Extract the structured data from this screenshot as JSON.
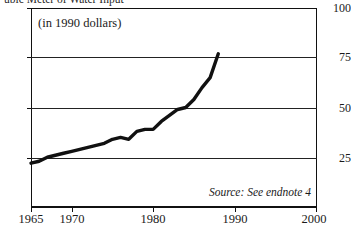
{
  "figure": {
    "running_title": "ubic Meter of Water Input",
    "units_note": "(in 1990 dollars)",
    "source_note": "Source: See endnote 4"
  },
  "axis": {
    "y_labels": [
      "100",
      "75",
      "50",
      "25"
    ],
    "x_labels": [
      "1965",
      "1970",
      "1980",
      "1990",
      "2000"
    ]
  },
  "chart_data": {
    "type": "line",
    "title": "ubic Meter of Water Input",
    "subtitle": "(in 1990 dollars)",
    "xlabel": "",
    "ylabel": "",
    "xlim": [
      1965,
      2000
    ],
    "ylim": [
      0,
      100
    ],
    "yticks": [
      25,
      50,
      75,
      100
    ],
    "xticks": [
      1965,
      1970,
      1980,
      1990,
      2000
    ],
    "grid": "horizontal",
    "legend": "none",
    "annotations": [
      "(in 1990 dollars)",
      "Source: See endnote 4"
    ],
    "series": [
      {
        "name": "Value added per cubic meter of water input",
        "x": [
          1965,
          1966,
          1967,
          1968,
          1969,
          1970,
          1971,
          1972,
          1973,
          1974,
          1975,
          1976,
          1977,
          1978,
          1979,
          1980,
          1981,
          1982,
          1983,
          1984,
          1985,
          1986,
          1987,
          1988
        ],
        "values": [
          22,
          23,
          25,
          26,
          27,
          28,
          29,
          30,
          31,
          32,
          34,
          35,
          34,
          38,
          39,
          39,
          43,
          46,
          49,
          50,
          54,
          60,
          65,
          77
        ]
      }
    ]
  }
}
